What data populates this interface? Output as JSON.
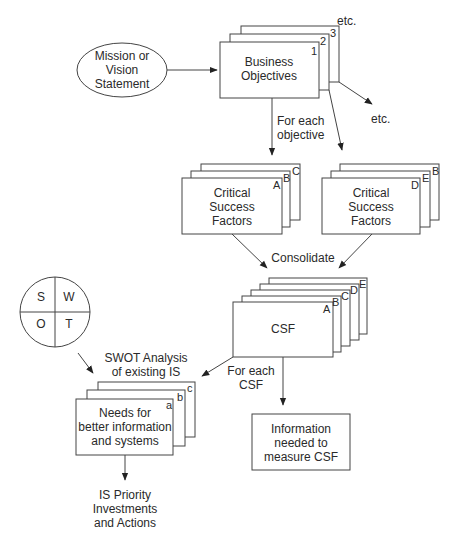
{
  "mission": {
    "lines": [
      "Mission or",
      "Vision",
      "Statement"
    ]
  },
  "business_objectives": {
    "lines": [
      "Business",
      "Objectives"
    ],
    "stack_labels": [
      "1",
      "2",
      "3"
    ],
    "etc_top": "etc.",
    "etc_side": "etc."
  },
  "for_each_objective": {
    "lines": [
      "For each",
      "objective"
    ]
  },
  "csf_left": {
    "lines": [
      "Critical",
      "Success",
      "Factors"
    ],
    "stack_labels": [
      "A",
      "B",
      "C"
    ]
  },
  "csf_right": {
    "lines": [
      "Critical",
      "Success",
      "Factors"
    ],
    "stack_labels": [
      "D",
      "E",
      "B"
    ]
  },
  "consolidate": "Consolidate",
  "csf_consolidated": {
    "label": "CSF",
    "stack_labels": [
      "A",
      "B",
      "C",
      "D",
      "E"
    ]
  },
  "swot": {
    "quadrants": [
      "S",
      "W",
      "O",
      "T"
    ]
  },
  "swot_analysis": {
    "lines": [
      "SWOT Analysis",
      "of existing IS"
    ]
  },
  "for_each_csf": {
    "lines": [
      "For each",
      "CSF"
    ]
  },
  "needs": {
    "lines": [
      "Needs for",
      "better information",
      "and systems"
    ],
    "stack_labels": [
      "a",
      "b",
      "c"
    ]
  },
  "information": {
    "lines": [
      "Information",
      "needed to",
      "measure CSF"
    ]
  },
  "priority": {
    "lines": [
      "IS Priority",
      "Investments",
      "and Actions"
    ]
  }
}
